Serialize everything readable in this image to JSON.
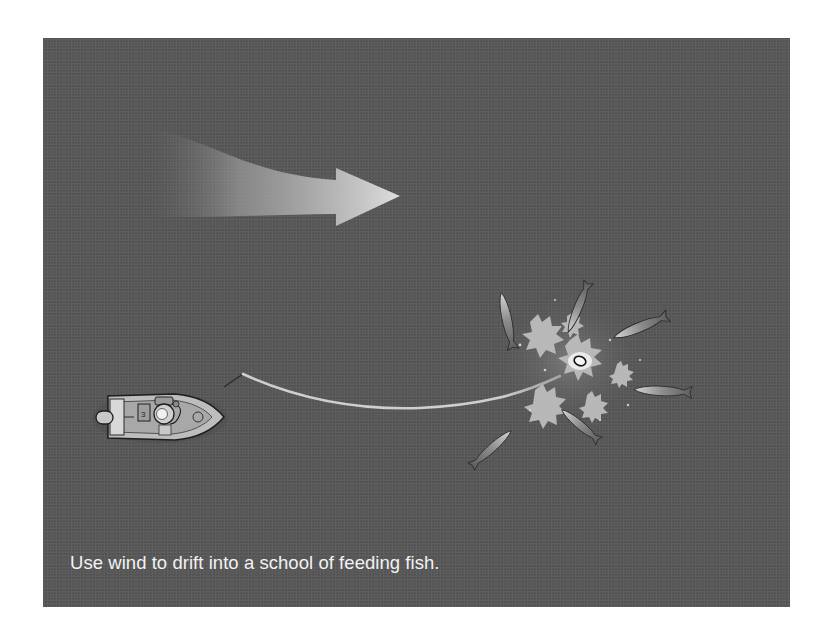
{
  "illustration": {
    "caption": "Use wind to drift into a school of feeding fish.",
    "elements": {
      "wind_arrow": "wind-direction-arrow",
      "boat": "boat-with-angler",
      "fishing_line": "fishing-line",
      "splash": "feeding-splash",
      "lure": "lure",
      "fish_count": 6
    },
    "colors": {
      "background": "#555555",
      "arrow": "#d9d9d9",
      "line": "#cfcfcf",
      "caption": "#f2f2f2",
      "splash": "#bdbdbd"
    }
  }
}
